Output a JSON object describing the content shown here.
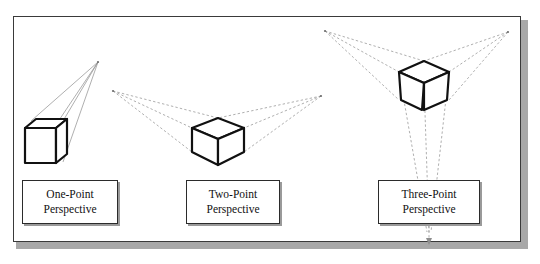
{
  "figure": {
    "clipped_caption_above": "",
    "frame": {
      "border_color": "#3a3a3a",
      "shadow_color": "#a8a8a8",
      "background": "#ffffff"
    }
  },
  "diagram": {
    "type": "perspective-projection-illustration",
    "stroke_cube": "#111111",
    "stroke_construction": "#8d8d8d",
    "panels": [
      {
        "id": "one-point",
        "label_line1": "One-Point",
        "label_line2": "Perspective",
        "vanishing_points": 1,
        "vp_coords": [
          [
            98,
            62
          ]
        ],
        "cube_center": [
          48,
          142
        ]
      },
      {
        "id": "two-point",
        "label_line1": "Two-Point",
        "label_line2": "Perspective",
        "vanishing_points": 2,
        "vp_coords": [
          [
            113,
            91
          ],
          [
            321,
            96
          ]
        ],
        "cube_center": [
          218,
          140
        ]
      },
      {
        "id": "three-point",
        "label_line1": "Three-Point",
        "label_line2": "Perspective",
        "vanishing_points": 3,
        "vp_coords": [
          [
            325,
            31
          ],
          [
            508,
            32
          ],
          [
            429,
            235
          ]
        ],
        "cube_center": [
          424,
          84
        ]
      }
    ]
  },
  "labels": {
    "one_point": {
      "line1": "One-Point",
      "line2": "Perspective"
    },
    "two_point": {
      "line1": "Two-Point",
      "line2": "Perspective"
    },
    "three_point": {
      "line1": "Three-Point",
      "line2": "Perspective"
    }
  }
}
